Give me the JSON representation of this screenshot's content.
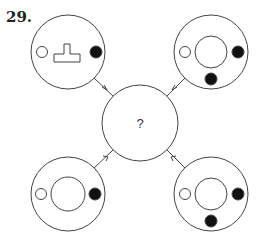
{
  "question": {
    "number": "29.",
    "center_label": "?"
  },
  "colors": {
    "stroke": "#444444",
    "fill_dark": "#111111",
    "background": "#ffffff"
  },
  "figures": [
    {
      "position": "top-left",
      "contents": [
        "hollow-small-circle-left",
        "T-shape-center",
        "filled-dot-right"
      ]
    },
    {
      "position": "top-right",
      "contents": [
        "hollow-small-circle-left",
        "inner-ring-center",
        "filled-dot-right",
        "filled-dot-bottom"
      ]
    },
    {
      "position": "bottom-left",
      "contents": [
        "hollow-small-circle-left",
        "inner-ring-center",
        "filled-dot-right"
      ]
    },
    {
      "position": "bottom-right",
      "contents": [
        "hollow-small-circle-left",
        "inner-ring-center",
        "filled-dot-right",
        "filled-dot-bottom"
      ]
    }
  ]
}
